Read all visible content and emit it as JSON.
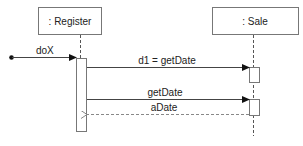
{
  "diagram": {
    "type": "UML sequence diagram",
    "participants": [
      {
        "id": "register",
        "label": ": Register"
      },
      {
        "id": "sale",
        "label": ": Sale"
      }
    ],
    "messages": [
      {
        "id": "m1",
        "label": "doX",
        "from": "found",
        "to": "register",
        "kind": "sync"
      },
      {
        "id": "m2",
        "label": "d1 = getDate",
        "from": "register",
        "to": "sale",
        "kind": "sync"
      },
      {
        "id": "m3",
        "label": "getDate",
        "from": "register",
        "to": "sale",
        "kind": "sync"
      },
      {
        "id": "m4",
        "label": "aDate",
        "from": "sale",
        "to": "register",
        "kind": "return"
      }
    ]
  }
}
